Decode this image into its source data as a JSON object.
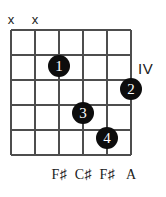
{
  "diagram": {
    "type": "guitar-chord-diagram",
    "title": "",
    "position_label": "IV",
    "strings_count": 6,
    "frets_count": 5,
    "geometry": {
      "string_x": [
        11,
        35,
        59,
        83,
        107,
        131
      ],
      "fret_y": [
        30,
        55,
        80,
        105,
        130,
        155
      ]
    },
    "colors": {
      "grid": "#4d4d4d",
      "dot_fill": "#0d0d0d",
      "dot_text": "#ffffff",
      "text": "#1a1a1a",
      "background": "#ffffff"
    },
    "mutes": [
      {
        "label": "x",
        "string_index": 0,
        "x": 11,
        "y": 13
      },
      {
        "label": "x",
        "string_index": 1,
        "x": 35,
        "y": 13
      }
    ],
    "fingers": [
      {
        "label": "1",
        "string_index": 2,
        "fret": 2,
        "x": 59,
        "y": 66
      },
      {
        "label": "2",
        "string_index": 5,
        "fret": 3,
        "x": 131,
        "y": 89
      },
      {
        "label": "3",
        "string_index": 3,
        "fret": 4,
        "x": 83,
        "y": 113
      },
      {
        "label": "4",
        "string_index": 4,
        "fret": 5,
        "x": 107,
        "y": 138
      }
    ],
    "note_labels": [
      {
        "text": "F♯",
        "string_index": 2,
        "x": 59,
        "y": 167
      },
      {
        "text": "C♯",
        "string_index": 3,
        "x": 83,
        "y": 167
      },
      {
        "text": "F♯",
        "string_index": 4,
        "x": 107,
        "y": 167
      },
      {
        "text": "A",
        "string_index": 5,
        "x": 131,
        "y": 167
      }
    ],
    "position_marker": {
      "text": "IV",
      "x": 138,
      "y": 61
    }
  }
}
